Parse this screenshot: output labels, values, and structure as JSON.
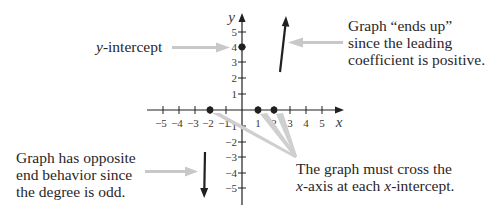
{
  "figure": {
    "annotations": {
      "y_intercept": {
        "label_italic": "y",
        "label_rest": "-intercept"
      },
      "ends_up": {
        "lines": [
          "Graph “ends up”",
          "since the leading",
          "coefficient is positive."
        ]
      },
      "opposite_end": {
        "lines": [
          "Graph has opposite",
          "end behavior since",
          "the degree is odd."
        ]
      },
      "cross_axis": {
        "line1": "The graph must cross the",
        "line2_italic_a": "x",
        "line2_mid": "-axis at each ",
        "line2_italic_b": "x",
        "line2_rest": "-intercept."
      }
    },
    "axes": {
      "x_label": "x",
      "y_label": "y",
      "x_ticks": [
        "−5",
        "−4",
        "−3",
        "−2",
        "−1",
        "1",
        "2",
        "3",
        "4",
        "5"
      ],
      "y_ticks": [
        "5",
        "4",
        "3",
        "2",
        "1",
        "−1",
        "−2",
        "−3",
        "−4",
        "−5"
      ]
    },
    "points": {
      "y_intercept": [
        0,
        4
      ],
      "x_intercepts": [
        [
          -2,
          0
        ],
        [
          1,
          0
        ],
        [
          2,
          0
        ]
      ]
    },
    "colors": {
      "ink": "#231f20",
      "pointer": "#c8c8c8"
    }
  }
}
